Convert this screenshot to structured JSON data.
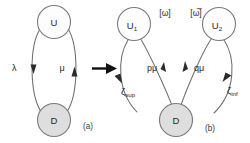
{
  "figure": {
    "title": "",
    "colors": {
      "background": "#ffffff",
      "node_open_fill": "#fdfdfd",
      "node_filled_fill": "#dedede",
      "node_stroke": "#7b7b7b",
      "edge_stroke": "#6e6e6e",
      "arrow_fill": "#2b2b2b",
      "text": "#2a2a2a"
    }
  },
  "panel_a": {
    "caption": "(a)",
    "nodes": [
      {
        "id": "U",
        "label": "U",
        "style": "open"
      },
      {
        "id": "D",
        "label": "D",
        "style": "filled"
      }
    ],
    "transitions": [
      {
        "id": "U-to-D",
        "label": "λ",
        "from": "U",
        "to": "D",
        "direction": "down"
      },
      {
        "id": "D-to-U",
        "label": "μ",
        "from": "D",
        "to": "U",
        "direction": "up"
      }
    ]
  },
  "transform_arrow": {
    "name": "rightwards-arrow",
    "glyph": "→"
  },
  "panel_b": {
    "caption": "(b)",
    "nodes": [
      {
        "id": "U1",
        "label": "U",
        "subscript": "1",
        "style": "open"
      },
      {
        "id": "U2",
        "label": "U",
        "subscript": "2",
        "style": "open"
      },
      {
        "id": "D",
        "label": "D",
        "style": "filled"
      }
    ],
    "bracket_labels": [
      {
        "id": "omega",
        "text": "[ω]",
        "for": "U1"
      },
      {
        "id": "omega-bar",
        "text": "[ω̅]",
        "for": "U2"
      }
    ],
    "transitions": [
      {
        "id": "D-to-U1",
        "label": "pμ",
        "from": "D",
        "to": "U1",
        "direction": "up"
      },
      {
        "id": "D-to-U2",
        "label": "qμ",
        "from": "D",
        "to": "U2",
        "direction": "up"
      },
      {
        "id": "U1-to-D",
        "label": "ζ",
        "subscript": "sup",
        "from": "U1",
        "to": "D",
        "direction": "down"
      },
      {
        "id": "U2-to-D",
        "label": "ζ",
        "subscript": "inf",
        "from": "U2",
        "to": "D",
        "direction": "down"
      }
    ]
  }
}
